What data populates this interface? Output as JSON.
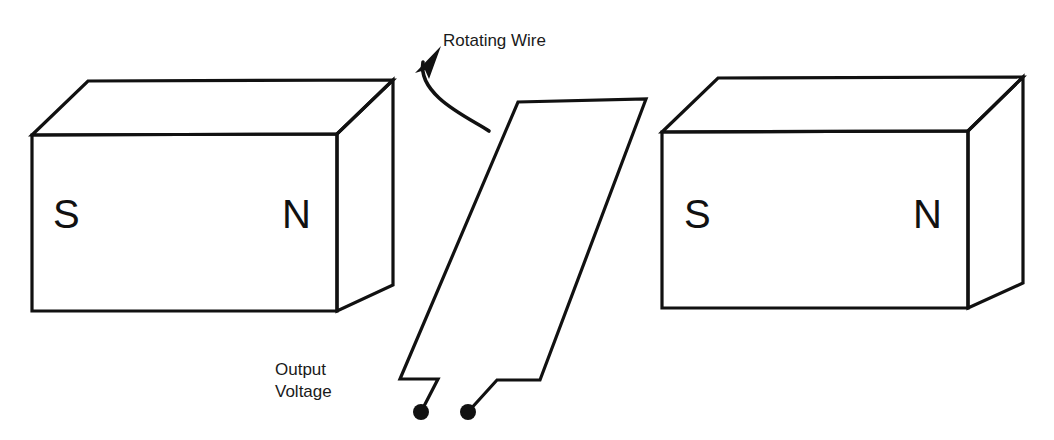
{
  "figure": {
    "background_color": "#ffffff",
    "line_color": "#111111"
  },
  "labels": {
    "rotating_wire": "Rotating Wire",
    "output_voltage_line1": "Output",
    "output_voltage_line2": "Voltage"
  },
  "magnets": [
    {
      "id": "left-magnet",
      "south_pole": "S",
      "north_pole": "N"
    },
    {
      "id": "right-magnet",
      "south_pole": "S",
      "north_pole": "N"
    }
  ],
  "wire_loop": {
    "name": "rotating-wire-loop",
    "terminal_count": 2
  },
  "rotation_arrow": {
    "name": "rotation-direction-arrow",
    "direction": "counterclockwise-up"
  }
}
